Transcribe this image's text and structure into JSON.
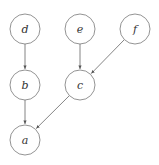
{
  "diagram": {
    "type": "directed-graph",
    "stroke_color": "#666666",
    "nodes": [
      {
        "id": "d",
        "label": "d",
        "x": 25,
        "y": 29
      },
      {
        "id": "e",
        "label": "e",
        "x": 80,
        "y": 29
      },
      {
        "id": "f",
        "label": "f",
        "x": 135,
        "y": 29
      },
      {
        "id": "b",
        "label": "b",
        "x": 25,
        "y": 85
      },
      {
        "id": "c",
        "label": "c",
        "x": 80,
        "y": 85
      },
      {
        "id": "a",
        "label": "a",
        "x": 25,
        "y": 140
      }
    ],
    "edges": [
      {
        "from": "d",
        "to": "b"
      },
      {
        "from": "e",
        "to": "c"
      },
      {
        "from": "f",
        "to": "c"
      },
      {
        "from": "b",
        "to": "a"
      },
      {
        "from": "c",
        "to": "a"
      }
    ]
  }
}
